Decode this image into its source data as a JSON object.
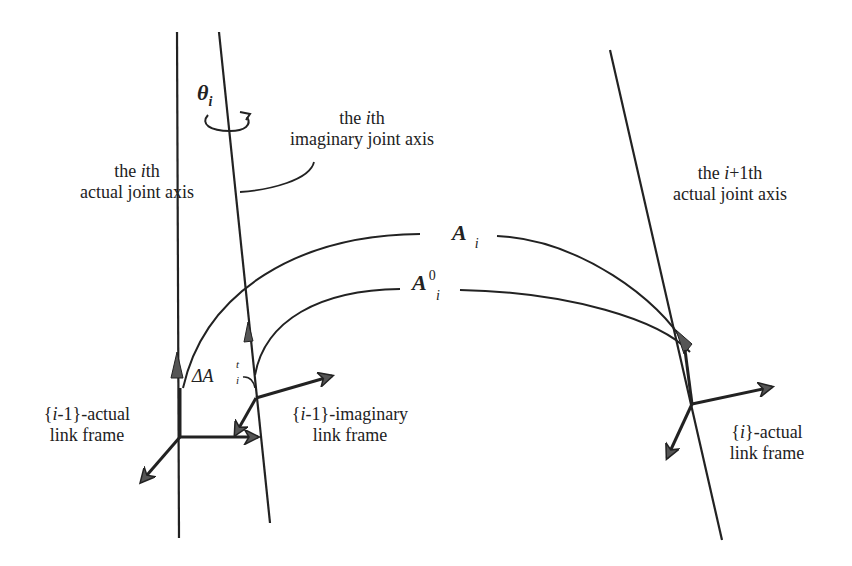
{
  "diagram": {
    "type": "robot-kinematics-joint-axes",
    "colors": {
      "line": "#222222",
      "arrow_fill": "#555555",
      "background": "#ffffff"
    },
    "labels": {
      "theta": {
        "symbol": "θ",
        "subscript": "i"
      },
      "ith_imaginary_axis": {
        "line1_pre": "the ",
        "line1_var": "i",
        "line1_post": "th",
        "line2": "imaginary joint axis"
      },
      "ith_actual_axis": {
        "line1_pre": "the ",
        "line1_var": "i",
        "line1_post": "th",
        "line2": "actual joint axis"
      },
      "i1th_actual_axis": {
        "line1_pre": "the ",
        "line1_var": "i",
        "line1_post": "+1th",
        "line2": "actual joint axis"
      },
      "A_i": {
        "symbol": "A",
        "subscript": "i"
      },
      "A_i_0": {
        "symbol": "A",
        "subscript": "i",
        "superscript": "0"
      },
      "delta_A": {
        "symbol": "ΔA",
        "subscript": "i",
        "superscript": "t"
      },
      "frame_i_minus_1_actual": {
        "line1_pre": "{",
        "line1_var": "i",
        "line1_post": "-1}-actual",
        "line2": "link frame"
      },
      "frame_i_minus_1_imaginary": {
        "line1_pre": "{",
        "line1_var": "i",
        "line1_post": "-1}-imaginary",
        "line2": "link frame"
      },
      "frame_i_actual": {
        "line1_pre": "{",
        "line1_var": "i",
        "line1_post": "}-actual",
        "line2": "link frame"
      }
    },
    "axes_lines": [
      {
        "name": "ith-actual-joint-axis",
        "x1": 177,
        "y1": 32,
        "x2": 179,
        "y2": 538
      },
      {
        "name": "ith-imaginary-joint-axis",
        "x1": 219,
        "y1": 32,
        "x2": 270,
        "y2": 523
      },
      {
        "name": "i1th-actual-joint-axis",
        "x1": 610,
        "y1": 50,
        "x2": 722,
        "y2": 540
      }
    ]
  }
}
